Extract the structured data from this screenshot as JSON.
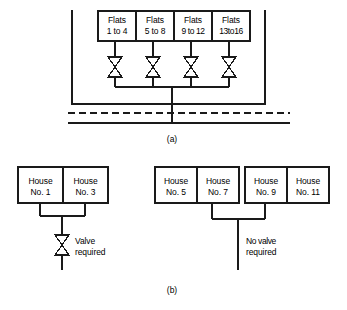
{
  "figure": {
    "type": "plumbing-schematic"
  },
  "panel_a": {
    "caption": "(a)",
    "building": {
      "name": "block-of-flats",
      "ground_line_style": "dashed",
      "main_line_style": "solid"
    },
    "units": [
      {
        "line1": "Flats",
        "line2": "1 to 4"
      },
      {
        "line1": "Flats",
        "line2": "5 to 8"
      },
      {
        "line1": "Flats",
        "line2": "9 to 12"
      },
      {
        "line1": "Flats",
        "line2": "13to16"
      }
    ],
    "valve_count": 4,
    "valve_symbol": "gate-valve-bowtie"
  },
  "panel_b": {
    "caption": "(b)",
    "groups": [
      {
        "name": "left-pair",
        "houses": [
          {
            "line1": "House",
            "line2": "No. 1"
          },
          {
            "line1": "House",
            "line2": "No. 3"
          }
        ],
        "note_line1": "Valve",
        "note_line2": "required",
        "has_valve": true
      },
      {
        "name": "right-quad",
        "houses": [
          {
            "line1": "House",
            "line2": "No. 5"
          },
          {
            "line1": "House",
            "line2": "No. 7"
          },
          {
            "line1": "House",
            "line2": "No. 9"
          },
          {
            "line1": "House",
            "line2": "No. 11"
          }
        ],
        "note_line1": "No valve",
        "note_line2": "required",
        "has_valve": false
      }
    ]
  },
  "colors": {
    "line": "#1a1a1a",
    "background": "#ffffff",
    "text": "#000000"
  }
}
